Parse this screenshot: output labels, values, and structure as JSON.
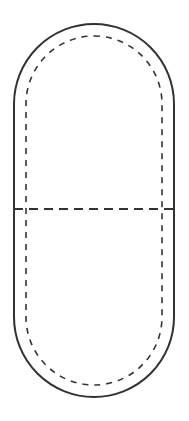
{
  "diagram": {
    "type": "capsule-pattern",
    "colors": {
      "background": "#ffffff",
      "stroke": "#333333"
    },
    "outer_outline": {
      "x": 14,
      "y": 24,
      "width": 160,
      "height": 373,
      "radius": 80,
      "style": "solid"
    },
    "inner_seam": {
      "x": 26,
      "y": 36,
      "width": 136,
      "height": 349,
      "radius": 68,
      "style": "dashed"
    },
    "fold_line": {
      "y": 209,
      "x1": 14,
      "x2": 174,
      "style": "dashed"
    }
  }
}
